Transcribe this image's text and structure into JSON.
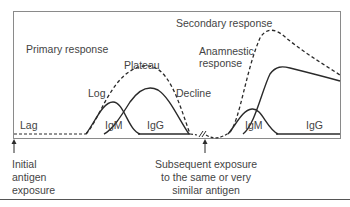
{
  "diagram": {
    "labels": {
      "primary_response": "Primary response",
      "secondary_response": "Secondary response",
      "plateau": "Plateau",
      "log": "Log",
      "decline": "Decline",
      "lag": "Lag",
      "anamnestic_line1": "Anamnestic",
      "anamnestic_line2": "response",
      "igm_primary": "IgM",
      "igg_primary": "IgG",
      "igm_secondary": "IgM",
      "igg_secondary": "IgG"
    },
    "annotations": {
      "initial_line1": "Initial",
      "initial_line2": "antigen",
      "initial_line3": "exposure",
      "subsequent_line1": "Subsequent exposure",
      "subsequent_line2": "to the same or very",
      "subsequent_line3": "similar antigen"
    },
    "colors": {
      "frame": "#8a8a8a",
      "curve": "#2a2a2a",
      "text": "#444444"
    }
  }
}
